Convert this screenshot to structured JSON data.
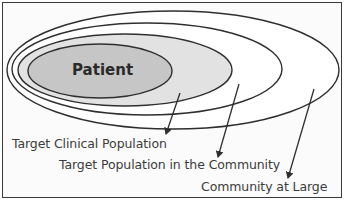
{
  "diagram": {
    "type": "nested-ellipses",
    "colors": {
      "frame": "#3a3a3a",
      "ellipse_stroke": "#2f2f2f",
      "patient_fill": "#c6c6c6",
      "clinical_fill": "#e2e2e2",
      "community_fill": "#ffffff",
      "large_fill": "#ffffff",
      "text": "#3c3c3c"
    },
    "ellipses": [
      {
        "id": "community-at-large",
        "label": "Community at Large",
        "cx": 173,
        "cy": 70,
        "rx": 166,
        "ry": 59
      },
      {
        "id": "target-population-in-community",
        "label": "Target Population in the Community",
        "cx": 147,
        "cy": 69,
        "rx": 135,
        "ry": 46
      },
      {
        "id": "target-clinical-population",
        "label": "Target Clinical Population",
        "cx": 125,
        "cy": 70,
        "rx": 107,
        "ry": 36
      },
      {
        "id": "patient",
        "label": "Patient",
        "cx": 100,
        "cy": 71,
        "rx": 72,
        "ry": 27
      }
    ],
    "center_label": "Patient",
    "callouts": [
      {
        "label": "Target Clinical Population",
        "arrow_from": [
          180,
          93
        ],
        "arrow_to": [
          166,
          134
        ]
      },
      {
        "label": "Target Population in the Community",
        "arrow_from": [
          239,
          84
        ],
        "arrow_to": [
          218,
          157
        ]
      },
      {
        "label": "Community at Large",
        "arrow_from": [
          314,
          89
        ],
        "arrow_to": [
          288,
          178
        ]
      }
    ]
  }
}
